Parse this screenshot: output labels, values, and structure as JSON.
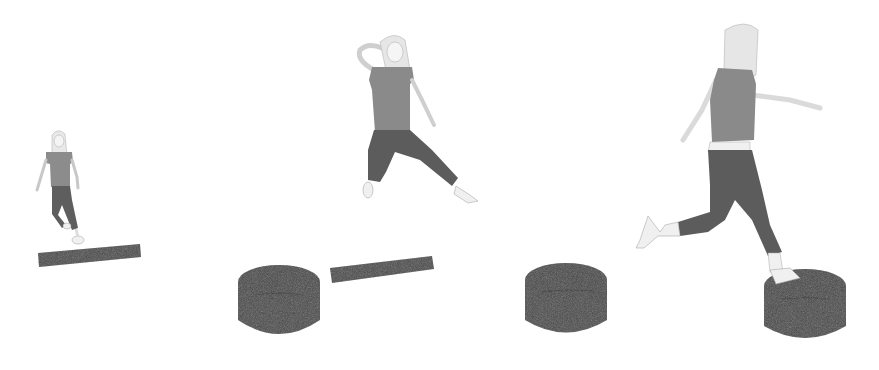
{
  "scene": {
    "description": "Grayscale illustration sequence of a girl jumping between balance beams and cylindrical stepping pods",
    "colors": {
      "background": "#ffffff",
      "equipment": "#4a4a4a",
      "equipment_dark": "#3a3a3a",
      "shirt": "#8a8a8a",
      "pants": "#5e5e5e",
      "skin": "#f2f2f2",
      "hair": "#e4e4e4",
      "outline": "#9a9a9a"
    },
    "figures": [
      {
        "id": "girl-1",
        "pose": "stepping onto beam",
        "x": 60,
        "y": 130
      },
      {
        "id": "girl-2",
        "pose": "mid-air jump, hand to head",
        "x": 400,
        "y": 35
      },
      {
        "id": "girl-3",
        "pose": "running leap onto pod",
        "x": 720,
        "y": 25
      }
    ],
    "equipment": [
      {
        "id": "beam-1",
        "type": "balance-beam",
        "x": 38,
        "y": 245
      },
      {
        "id": "pod-1",
        "type": "stepping-pod",
        "x": 238,
        "y": 265
      },
      {
        "id": "beam-2",
        "type": "balance-beam",
        "x": 330,
        "y": 255
      },
      {
        "id": "pod-2",
        "type": "stepping-pod",
        "x": 525,
        "y": 262
      },
      {
        "id": "pod-3",
        "type": "stepping-pod",
        "x": 764,
        "y": 270
      }
    ]
  }
}
